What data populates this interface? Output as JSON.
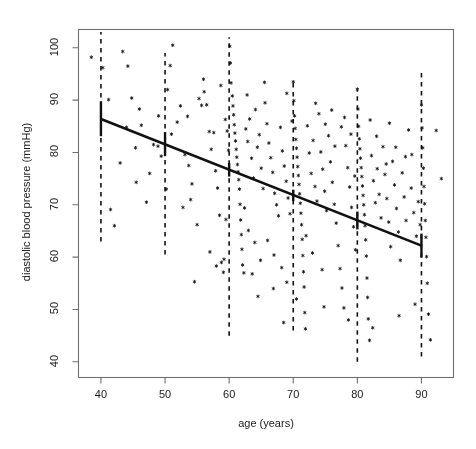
{
  "chart_data": {
    "type": "scatter",
    "title": "",
    "xlabel": "age (years)",
    "ylabel": "diastolic blood pressure (mmHg)",
    "xlim": [
      36.5,
      95.0
    ],
    "ylim": [
      37.0,
      103.5
    ],
    "xticks": [
      40,
      50,
      60,
      70,
      80,
      90
    ],
    "yticks": [
      40,
      50,
      60,
      70,
      80,
      90,
      100
    ],
    "grid": false,
    "legend": null,
    "marker": "asterisk",
    "marker_color": "#000000",
    "line_color": "#000000",
    "series": [
      {
        "name": "regression line",
        "type": "line",
        "style": "solid",
        "x": [
          40,
          90
        ],
        "y": [
          86.4,
          62.2
        ]
      },
      {
        "name": "confidence intervals",
        "type": "errorbar",
        "style": "solid-vertical",
        "x": [
          40,
          50,
          60,
          70,
          80,
          90
        ],
        "y": [
          86.4,
          81.6,
          76.7,
          71.8,
          67.0,
          62.2
        ],
        "ylow": [
          83.1,
          79.3,
          75.4,
          70.7,
          65.3,
          59.9
        ],
        "yhigh": [
          89.8,
          83.9,
          78.0,
          72.9,
          68.7,
          64.5
        ]
      },
      {
        "name": "decade reference lines",
        "type": "vline",
        "style": "dashed",
        "x": [
          40,
          50,
          60,
          70,
          80,
          90
        ],
        "ymin": [
          63.0,
          60.5,
          45.0,
          46.0,
          40.0,
          41.0
        ],
        "ymax": [
          103.0,
          99.0,
          102.0,
          94.0,
          92.0,
          96.0
        ]
      },
      {
        "name": "observations",
        "type": "scatter",
        "points": [
          [
            38.5,
            98.2
          ],
          [
            40.3,
            96.2
          ],
          [
            41.2,
            90.1
          ],
          [
            41.5,
            69.1
          ],
          [
            42.1,
            66.0
          ],
          [
            43.4,
            99.3
          ],
          [
            44.2,
            96.5
          ],
          [
            44.8,
            90.4
          ],
          [
            45.4,
            80.9
          ],
          [
            46.3,
            85.2
          ],
          [
            47.1,
            70.5
          ],
          [
            48.2,
            81.5
          ],
          [
            48.9,
            81.2
          ],
          [
            49.4,
            79.3
          ],
          [
            50.4,
            92.0
          ],
          [
            50.8,
            96.6
          ],
          [
            51.2,
            100.5
          ],
          [
            51.9,
            85.8
          ],
          [
            52.4,
            88.9
          ],
          [
            53.1,
            79.6
          ],
          [
            53.7,
            77.5
          ],
          [
            54.2,
            74.0
          ],
          [
            54.6,
            55.3
          ],
          [
            55.3,
            90.3
          ],
          [
            55.7,
            89.0
          ],
          [
            56.1,
            91.6
          ],
          [
            56.5,
            89.1
          ],
          [
            56.9,
            84.0
          ],
          [
            57.2,
            80.6
          ],
          [
            57.6,
            83.8
          ],
          [
            57.9,
            76.5
          ],
          [
            58.2,
            73.2
          ],
          [
            58.5,
            68.0
          ],
          [
            58.8,
            59.0
          ],
          [
            59.1,
            57.1
          ],
          [
            59.4,
            86.3
          ],
          [
            59.7,
            84.1
          ],
          [
            59.9,
            80.4
          ],
          [
            60.1,
            100.3
          ],
          [
            60.2,
            97.1
          ],
          [
            60.3,
            93.3
          ],
          [
            60.5,
            90.8
          ],
          [
            60.6,
            88.9
          ],
          [
            60.7,
            87.2
          ],
          [
            60.8,
            85.3
          ],
          [
            60.9,
            83.7
          ],
          [
            61.0,
            82.2
          ],
          [
            61.1,
            80.6
          ],
          [
            61.2,
            79.1
          ],
          [
            61.3,
            77.7
          ],
          [
            61.4,
            76.3
          ],
          [
            61.5,
            74.8
          ],
          [
            61.6,
            73.0
          ],
          [
            61.7,
            70.1
          ],
          [
            61.8,
            67.1
          ],
          [
            61.9,
            64.3
          ],
          [
            62.0,
            61.5
          ],
          [
            62.1,
            58.5
          ],
          [
            62.3,
            57.0
          ],
          [
            62.6,
            84.5
          ],
          [
            62.9,
            82.1
          ],
          [
            63.2,
            86.4
          ],
          [
            63.5,
            78.9
          ],
          [
            63.8,
            75.1
          ],
          [
            64.1,
            88.2
          ],
          [
            64.4,
            81.0
          ],
          [
            64.7,
            83.4
          ],
          [
            65.0,
            77.0
          ],
          [
            65.3,
            73.1
          ],
          [
            65.6,
            89.5
          ],
          [
            65.9,
            85.5
          ],
          [
            66.2,
            81.8
          ],
          [
            66.5,
            79.0
          ],
          [
            66.8,
            76.2
          ],
          [
            67.1,
            72.2
          ],
          [
            67.4,
            70.0
          ],
          [
            67.7,
            67.9
          ],
          [
            68.0,
            84.8
          ],
          [
            68.3,
            80.3
          ],
          [
            68.6,
            77.4
          ],
          [
            68.9,
            74.5
          ],
          [
            69.2,
            71.3
          ],
          [
            69.5,
            68.3
          ],
          [
            69.8,
            86.0
          ],
          [
            70.0,
            93.5
          ],
          [
            70.1,
            89.9
          ],
          [
            70.2,
            87.0
          ],
          [
            70.3,
            84.6
          ],
          [
            70.4,
            82.5
          ],
          [
            70.5,
            80.8
          ],
          [
            70.6,
            79.1
          ],
          [
            70.7,
            77.3
          ],
          [
            70.8,
            75.6
          ],
          [
            70.9,
            73.9
          ],
          [
            71.0,
            72.1
          ],
          [
            71.1,
            70.3
          ],
          [
            71.2,
            68.4
          ],
          [
            71.3,
            66.2
          ],
          [
            71.4,
            63.4
          ],
          [
            71.5,
            60.3
          ],
          [
            71.6,
            57.2
          ],
          [
            71.7,
            54.3
          ],
          [
            71.8,
            49.4
          ],
          [
            71.9,
            46.3
          ],
          [
            72.2,
            85.1
          ],
          [
            72.5,
            79.9
          ],
          [
            72.8,
            76.0
          ],
          [
            73.1,
            82.3
          ],
          [
            73.4,
            73.5
          ],
          [
            73.7,
            70.7
          ],
          [
            74.0,
            87.4
          ],
          [
            74.3,
            80.1
          ],
          [
            74.6,
            76.8
          ],
          [
            74.9,
            72.6
          ],
          [
            75.2,
            68.9
          ],
          [
            75.5,
            83.2
          ],
          [
            75.8,
            78.2
          ],
          [
            76.1,
            74.3
          ],
          [
            76.4,
            70.1
          ],
          [
            76.7,
            66.5
          ],
          [
            77.0,
            62.2
          ],
          [
            77.3,
            57.8
          ],
          [
            77.6,
            54.1
          ],
          [
            77.9,
            50.3
          ],
          [
            78.2,
            81.3
          ],
          [
            78.5,
            77.1
          ],
          [
            78.8,
            73.4
          ],
          [
            79.1,
            69.5
          ],
          [
            79.4,
            65.8
          ],
          [
            79.7,
            61.4
          ],
          [
            80.0,
            92.1
          ],
          [
            80.1,
            88.3
          ],
          [
            80.2,
            85.0
          ],
          [
            80.3,
            82.6
          ],
          [
            80.4,
            80.7
          ],
          [
            80.5,
            78.9
          ],
          [
            80.6,
            77.1
          ],
          [
            80.7,
            75.4
          ],
          [
            80.8,
            73.6
          ],
          [
            80.9,
            71.8
          ],
          [
            81.0,
            70.0
          ],
          [
            81.1,
            68.1
          ],
          [
            81.2,
            66.0
          ],
          [
            81.3,
            63.3
          ],
          [
            81.4,
            60.2
          ],
          [
            81.5,
            56.0
          ],
          [
            81.6,
            52.3
          ],
          [
            81.7,
            48.2
          ],
          [
            81.9,
            44.1
          ],
          [
            82.2,
            79.4
          ],
          [
            82.5,
            74.6
          ],
          [
            82.8,
            70.4
          ],
          [
            83.1,
            76.9
          ],
          [
            83.4,
            72.0
          ],
          [
            83.7,
            67.5
          ],
          [
            84.0,
            81.1
          ],
          [
            84.3,
            75.8
          ],
          [
            84.6,
            71.2
          ],
          [
            84.9,
            66.7
          ],
          [
            85.2,
            62.0
          ],
          [
            85.5,
            78.3
          ],
          [
            85.8,
            73.8
          ],
          [
            86.1,
            69.3
          ],
          [
            86.4,
            64.8
          ],
          [
            86.7,
            59.4
          ],
          [
            87.0,
            76.1
          ],
          [
            87.3,
            71.5
          ],
          [
            87.6,
            67.0
          ],
          [
            88.0,
            84.3
          ],
          [
            88.4,
            73.2
          ],
          [
            88.8,
            68.5
          ],
          [
            89.2,
            64.0
          ],
          [
            89.5,
            70.6
          ],
          [
            89.8,
            66.2
          ],
          [
            90.0,
            89.1
          ],
          [
            90.1,
            84.7
          ],
          [
            90.2,
            80.9
          ],
          [
            90.3,
            77.0
          ],
          [
            90.4,
            73.5
          ],
          [
            90.5,
            70.2
          ],
          [
            90.6,
            67.0
          ],
          [
            90.7,
            63.8
          ],
          [
            90.8,
            60.1
          ],
          [
            90.9,
            55.0
          ],
          [
            91.1,
            49.1
          ],
          [
            91.4,
            44.2
          ],
          [
            92.3,
            84.2
          ],
          [
            93.1,
            75.0
          ],
          [
            47.6,
            76.0
          ],
          [
            52.8,
            69.5
          ],
          [
            55.0,
            66.2
          ],
          [
            57.0,
            61.0
          ],
          [
            58.0,
            58.3
          ],
          [
            59.2,
            59.6
          ],
          [
            62.4,
            69.4
          ],
          [
            63.0,
            65.1
          ],
          [
            64.0,
            62.8
          ],
          [
            64.9,
            59.4
          ],
          [
            66.0,
            63.2
          ],
          [
            67.0,
            60.4
          ],
          [
            68.2,
            58.0
          ],
          [
            69.0,
            55.2
          ],
          [
            72.0,
            64.1
          ],
          [
            73.0,
            60.8
          ],
          [
            74.5,
            57.6
          ],
          [
            75.0,
            85.4
          ],
          [
            76.0,
            88.1
          ],
          [
            77.5,
            84.9
          ],
          [
            78.0,
            86.7
          ],
          [
            79.0,
            83.5
          ],
          [
            82.0,
            86.2
          ],
          [
            83.0,
            83.1
          ],
          [
            85.0,
            85.6
          ],
          [
            86.0,
            81.0
          ],
          [
            87.5,
            79.2
          ],
          [
            44.0,
            84.8
          ],
          [
            46.0,
            88.3
          ],
          [
            49.0,
            87.0
          ],
          [
            51.0,
            83.5
          ],
          [
            53.5,
            86.9
          ],
          [
            56.0,
            94.0
          ],
          [
            58.7,
            92.8
          ],
          [
            62.8,
            91.0
          ],
          [
            65.5,
            93.4
          ],
          [
            69.0,
            91.3
          ],
          [
            73.5,
            89.4
          ],
          [
            76.5,
            81.2
          ],
          [
            79.6,
            75.5
          ],
          [
            84.5,
            77.8
          ],
          [
            88.5,
            79.6
          ],
          [
            43.0,
            78.0
          ],
          [
            45.5,
            74.3
          ],
          [
            50.2,
            73.0
          ],
          [
            54.0,
            71.0
          ],
          [
            59.5,
            67.2
          ],
          [
            63.6,
            56.8
          ],
          [
            66.9,
            54.0
          ],
          [
            70.5,
            52.0
          ],
          [
            74.8,
            50.5
          ],
          [
            78.6,
            48.0
          ],
          [
            82.4,
            46.5
          ],
          [
            86.5,
            48.8
          ],
          [
            89.0,
            51.0
          ],
          [
            68.5,
            47.5
          ],
          [
            64.5,
            52.5
          ]
        ]
      }
    ]
  },
  "axes": {
    "x_tick_labels": [
      "40",
      "50",
      "60",
      "70",
      "80",
      "90"
    ],
    "y_tick_labels": [
      "40",
      "50",
      "60",
      "70",
      "80",
      "90",
      "100"
    ],
    "x_title": "age (years)",
    "y_title": "diastolic blood pressure (mmHg)"
  },
  "style": {
    "frame_color": "#6f6f6f",
    "tick_color": "#6f6f6f",
    "text_color": "#1a1a1a",
    "data_color": "#111111",
    "background": "#ffffff"
  }
}
